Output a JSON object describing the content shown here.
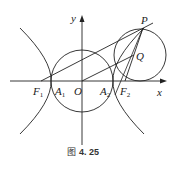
{
  "figure": {
    "caption_prefix": "图",
    "caption_number": "4. 25"
  },
  "axes": {
    "x_label": "x",
    "y_label": "y",
    "origin_label": "O"
  },
  "points": {
    "F1": {
      "name": "F",
      "sub": "1"
    },
    "F2": {
      "name": "F",
      "sub": "2"
    },
    "A1": {
      "name": "A",
      "sub": "1"
    },
    "A2": {
      "name": "A",
      "sub": "2"
    },
    "P": {
      "name": "P"
    },
    "Q": {
      "name": "Q"
    }
  },
  "colors": {
    "stroke": "#222222",
    "background": "#ffffff"
  }
}
